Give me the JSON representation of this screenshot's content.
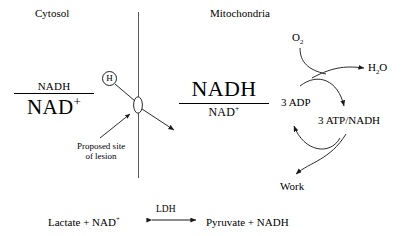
{
  "diagram": {
    "compartments": {
      "left_label": "Cytosol",
      "right_label": "Mitochondria"
    },
    "cytosol_ratio": {
      "numerator": "NADH",
      "denominator": "NAD",
      "denominator_charge": "+"
    },
    "mitochondria_ratio": {
      "numerator": "NADH",
      "denominator": "NAD",
      "denominator_charge": "+"
    },
    "shuttle": {
      "carrier_label": "H",
      "lesion_note_line1": "Proposed site",
      "lesion_note_line2": "of lesion"
    },
    "respiration": {
      "oxygen": "O",
      "oxygen_sub": "2",
      "water": "H",
      "water_sub": "2",
      "water_tail": "O",
      "adp": "3 ADP",
      "atp": "3 ATP/NADH",
      "work": "Work"
    },
    "ldh_equation": {
      "left_substrate": "Lactate",
      "plus_left": "+",
      "left_cosubstrate": "NAD",
      "left_charge": "+",
      "enzyme": "LDH",
      "right_product": "Pyruvate",
      "plus_right": "+",
      "right_cosubstrate": "NADH"
    },
    "colors": {
      "ink": "#000000",
      "membrane": "#555a5e",
      "background": "#ffffff"
    }
  }
}
